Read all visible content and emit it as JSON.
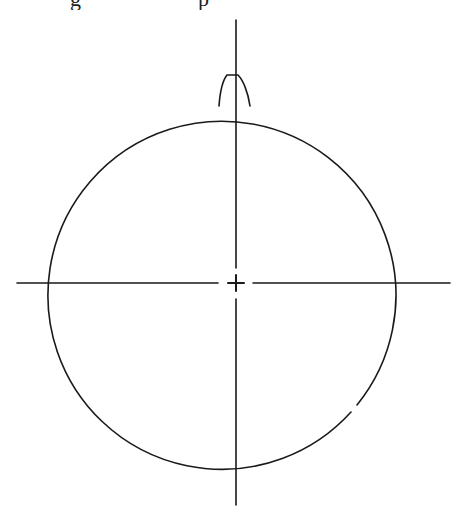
{
  "caption": {
    "visible_fragments": [
      "g",
      "p"
    ],
    "note_clipped": true
  },
  "diagram": {
    "stroke_color": "#1a1a1a",
    "background": "#ffffff",
    "circle": {
      "cx": 234,
      "cy": 282,
      "r": 174
    },
    "vertical_axis": {
      "x": 236,
      "y1": 20,
      "y2": 505
    },
    "horizontal_axis": {
      "y": 283,
      "x1": 17,
      "x2": 450
    },
    "center_mark": {
      "x": 236,
      "y": 283,
      "arm": 9
    },
    "protrusion": {
      "base_left": 218,
      "base_right": 251,
      "base_y": 105,
      "top_left": 226,
      "top_right": 238,
      "top_y": 75
    }
  }
}
